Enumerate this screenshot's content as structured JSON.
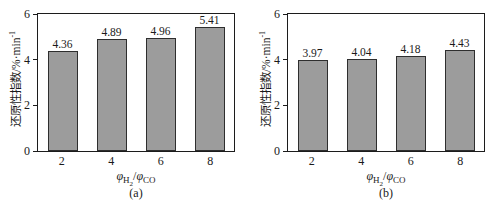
{
  "figure": {
    "ylabel_main": "还原性指数/%·min",
    "ylabel_sup": "-1",
    "xlabel": {
      "phi1": "φ",
      "gas1": "H",
      "gas1_sub": "2",
      "sep": "/",
      "phi2": "φ",
      "gas2": "CO"
    },
    "colors": {
      "bar_fill": "#9c9c9c",
      "bar_border": "#2e2e2e",
      "frame": "#1c1c1c",
      "text": "#1a1a1a",
      "background": "#ffffff"
    }
  },
  "chart_data": [
    {
      "type": "bar",
      "caption": "(a)",
      "categories": [
        "2",
        "4",
        "6",
        "8"
      ],
      "values": [
        4.36,
        4.89,
        4.96,
        5.41
      ],
      "value_labels": [
        "4.36",
        "4.89",
        "4.96",
        "5.41"
      ],
      "xlabel": "φH2/φCO",
      "ylabel": "还原性指数/%·min-1",
      "ylim": [
        0,
        6
      ],
      "yticks": [
        0,
        2,
        4,
        6
      ],
      "grid": false,
      "legend": "none"
    },
    {
      "type": "bar",
      "caption": "(b)",
      "categories": [
        "2",
        "4",
        "6",
        "8"
      ],
      "values": [
        3.97,
        4.04,
        4.18,
        4.43
      ],
      "value_labels": [
        "3.97",
        "4.04",
        "4.18",
        "4.43"
      ],
      "xlabel": "φH2/φCO",
      "ylabel": "还原性指数/%·min-1",
      "ylim": [
        0,
        6
      ],
      "yticks": [
        0,
        2,
        4,
        6
      ],
      "grid": false,
      "legend": "none"
    }
  ]
}
